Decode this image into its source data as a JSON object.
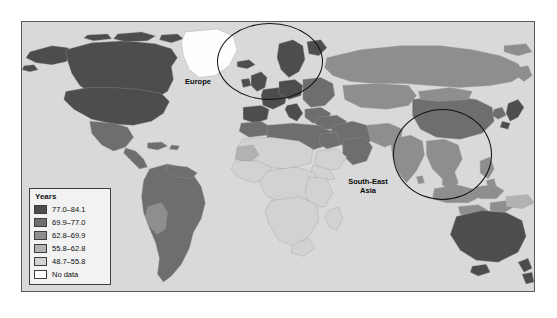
{
  "figure": {
    "caption_top": "",
    "caption_bottom": ""
  },
  "legend": {
    "title": "Years",
    "items": [
      {
        "label": "77.0–84.1",
        "color": "#4d4d4d"
      },
      {
        "label": "69.9–77.0",
        "color": "#6e6e6e"
      },
      {
        "label": "62.8–69.9",
        "color": "#8e8e8e"
      },
      {
        "label": "55.8–62.8",
        "color": "#b2b2b2"
      },
      {
        "label": "48.7–55.8",
        "color": "#d2d2d2"
      },
      {
        "label": "No data",
        "color": "#ffffff"
      }
    ]
  },
  "annotations": [
    {
      "name": "europe",
      "label": "Europe"
    },
    {
      "name": "south-east-asia",
      "label": "South-East\nAsia"
    }
  ],
  "chart_data": {
    "type": "map",
    "map_type": "choropleth",
    "title": "",
    "variable": "Life expectancy at birth",
    "unit": "Years",
    "projection": "equirectangular",
    "ocean_color": "#d9d9d9",
    "border_color": "#5a5a5a",
    "legend_title": "Years",
    "bins": [
      {
        "range": "77.0–84.1",
        "min": 77.0,
        "max": 84.1,
        "color": "#4d4d4d"
      },
      {
        "range": "69.9–77.0",
        "min": 69.9,
        "max": 77.0,
        "color": "#6e6e6e"
      },
      {
        "range": "62.8–69.9",
        "min": 62.8,
        "max": 69.9,
        "color": "#8e8e8e"
      },
      {
        "range": "55.8–62.8",
        "min": 55.8,
        "max": 62.8,
        "color": "#b2b2b2"
      },
      {
        "range": "48.7–55.8",
        "min": 48.7,
        "max": 55.8,
        "color": "#d2d2d2"
      },
      {
        "range": "No data",
        "min": null,
        "max": null,
        "color": "#ffffff"
      }
    ],
    "highlighted_regions": [
      "Europe",
      "South-East Asia"
    ],
    "region_shading": [
      {
        "region": "North America (Canada, USA)",
        "bin": "77.0–84.1"
      },
      {
        "region": "Greenland",
        "bin": "No data"
      },
      {
        "region": "Mexico / Central America",
        "bin": "69.9–77.0"
      },
      {
        "region": "South America",
        "bin": "69.9–77.0"
      },
      {
        "region": "Western Europe",
        "bin": "77.0–84.1"
      },
      {
        "region": "Eastern Europe",
        "bin": "69.9–77.0"
      },
      {
        "region": "North Africa",
        "bin": "69.9–77.0"
      },
      {
        "region": "Sub-Saharan Africa",
        "bin": "48.7–55.8"
      },
      {
        "region": "Middle East",
        "bin": "69.9–77.0"
      },
      {
        "region": "Russia",
        "bin": "62.8–69.9"
      },
      {
        "region": "China",
        "bin": "69.9–77.0"
      },
      {
        "region": "India",
        "bin": "62.8–69.9"
      },
      {
        "region": "South-East Asia",
        "bin": "62.8–69.9"
      },
      {
        "region": "Japan",
        "bin": "77.0–84.1"
      },
      {
        "region": "Australia / New Zealand",
        "bin": "77.0–84.1"
      }
    ]
  }
}
